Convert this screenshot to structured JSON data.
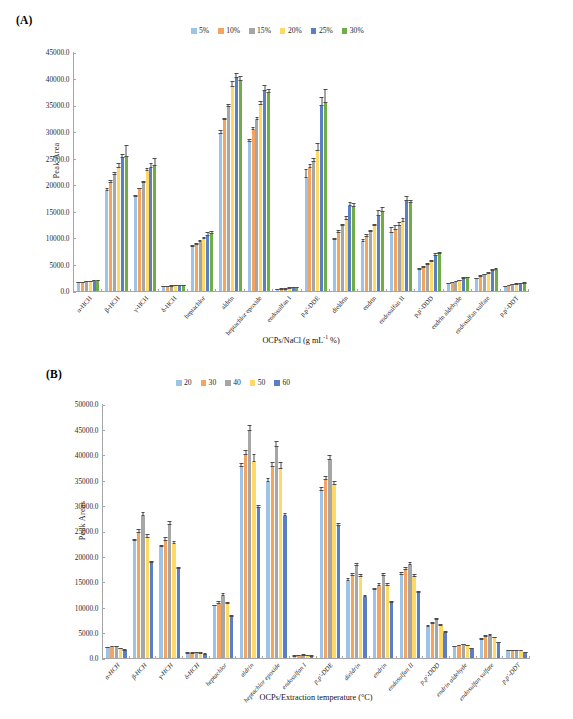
{
  "figure": {
    "panel_a_tag": "(A)",
    "panel_b_tag": "(B)"
  },
  "chart_data": [
    {
      "id": "A",
      "type": "bar",
      "title": "(A)",
      "xlabel": "OCPs/NaCl (g mL-1 %)",
      "xlabel_main": "OCPs/NaCl (g mL",
      "xlabel_sup": "-1",
      "xlabel_tail": " %)",
      "ylabel": "Peak Area",
      "ylim": [
        0,
        45000
      ],
      "ytick_step": 5000,
      "yticks": [
        "0.0",
        "5000.0",
        "10000.0",
        "15000.0",
        "20000.0",
        "25000.0",
        "30000.0",
        "35000.0",
        "40000.0",
        "45000.0"
      ],
      "grid": false,
      "legend_position": "top-center",
      "legend_title": "NaCl concentration",
      "categories": [
        "α-HCH",
        "β-HCH",
        "γ-HCH",
        "δ-HCH",
        "heptachlor",
        "aldrin",
        "heptachlor epoxide",
        "endosulfan I",
        "p,p'-DDE",
        "dieldrin",
        "endrin",
        "endosulfan II",
        "p,p'-DDD",
        "endrin aldehyde",
        "endosulfan sulfate",
        "p,p'-DDT"
      ],
      "colors": [
        "#9DC3E6",
        "#F4A460",
        "#A6A6A6",
        "#FFD966",
        "#5B7FC7",
        "#70AD47"
      ],
      "series": [
        {
          "name": "5%",
          "values": [
            1550,
            18900,
            17700,
            800,
            8400,
            29700,
            28100,
            250,
            21400,
            9600,
            9300,
            10900,
            3900,
            1400,
            2300,
            800
          ],
          "errors": [
            130,
            400,
            350,
            80,
            250,
            600,
            550,
            40,
            1300,
            400,
            450,
            900,
            300,
            120,
            180,
            90
          ]
        },
        {
          "name": "10%",
          "values": [
            1600,
            20400,
            19200,
            850,
            8700,
            32300,
            30400,
            300,
            23200,
            11000,
            10200,
            11600,
            4400,
            1550,
            2700,
            1000
          ],
          "errors": [
            140,
            500,
            250,
            90,
            250,
            350,
            500,
            45,
            600,
            500,
            400,
            700,
            250,
            130,
            200,
            100
          ]
        },
        {
          "name": "15%",
          "values": [
            1650,
            21900,
            20500,
            900,
            9200,
            34800,
            32300,
            350,
            24300,
            12200,
            11100,
            12200,
            4900,
            1700,
            3000,
            1100
          ],
          "errors": [
            180,
            500,
            300,
            100,
            350,
            500,
            450,
            50,
            650,
            450,
            400,
            650,
            300,
            160,
            250,
            110
          ]
        },
        {
          "name": "20%",
          "values": [
            1750,
            23300,
            22600,
            950,
            9800,
            38600,
            35200,
            500,
            26500,
            13500,
            12200,
            13000,
            5500,
            1900,
            3300,
            1250
          ],
          "errors": [
            170,
            700,
            500,
            110,
            400,
            900,
            550,
            60,
            1200,
            500,
            450,
            700,
            350,
            200,
            250,
            120
          ]
        },
        {
          "name": "25%",
          "values": [
            1900,
            25100,
            23300,
            1000,
            10400,
            40200,
            37900,
            600,
            34900,
            16000,
            14200,
            17000,
            6700,
            2300,
            3800,
            1350
          ],
          "errors": [
            180,
            600,
            750,
            120,
            550,
            750,
            900,
            80,
            1500,
            700,
            900,
            800,
            350,
            250,
            350,
            150
          ]
        },
        {
          "name": "30%",
          "values": [
            1900,
            25400,
            23600,
            1000,
            10800,
            39700,
            37400,
            600,
            35500,
            15800,
            15000,
            16600,
            7000,
            2400,
            4000,
            1400
          ],
          "errors": [
            190,
            1800,
            1300,
            120,
            500,
            800,
            600,
            80,
            2200,
            600,
            750,
            550,
            300,
            200,
            300,
            200
          ]
        }
      ]
    },
    {
      "id": "B",
      "type": "bar",
      "title": "(B)",
      "xlabel": "OCPs/Extraction temperature (°C)",
      "ylabel": "Peak  Areas",
      "ylim": [
        0,
        50000
      ],
      "ytick_step": 5000,
      "yticks": [
        "0.0",
        "5000.0",
        "10000.0",
        "15000.0",
        "20000.0",
        "25000.0",
        "30000.0",
        "35000.0",
        "40000.0",
        "45000.0",
        "50000.0"
      ],
      "grid": false,
      "legend_position": "top-center",
      "legend_title": "Extraction temperature",
      "categories": [
        "α-HCH",
        "β-HCH",
        "γ-HCH",
        "δ-HCH",
        "heptachlor",
        "aldrin",
        "heptachlor epoxide",
        "endosulfan I",
        "p,p'-DDE",
        "dieldrin",
        "endrin",
        "endosulfan II",
        "p,p'-DDD",
        "endrin aldehyde",
        "endosulfan sulfate",
        "p,p'-DDT"
      ],
      "colors": [
        "#9DC3E6",
        "#F4A460",
        "#A6A6A6",
        "#FFD966",
        "#5B7FC7"
      ],
      "series": [
        {
          "name": "20",
          "values": [
            1900,
            23100,
            21900,
            900,
            10200,
            37800,
            34800,
            350,
            33000,
            15300,
            13500,
            16500,
            6200,
            2200,
            3600,
            1400
          ],
          "errors": [
            170,
            400,
            300,
            90,
            300,
            550,
            700,
            50,
            600,
            400,
            350,
            450,
            250,
            180,
            250,
            130
          ]
        },
        {
          "name": "30",
          "values": [
            2100,
            24700,
            23200,
            950,
            10700,
            40200,
            37700,
            450,
            35100,
            16200,
            14300,
            17300,
            6700,
            2400,
            4200,
            1450
          ],
          "errors": [
            180,
            600,
            500,
            100,
            400,
            700,
            800,
            60,
            650,
            450,
            400,
            500,
            300,
            200,
            280,
            140
          ]
        },
        {
          "name": "40",
          "values": [
            2100,
            28000,
            26300,
            1000,
            12200,
            44900,
            41800,
            500,
            39200,
            18100,
            16200,
            18300,
            7500,
            2500,
            4300,
            1450
          ],
          "errors": [
            200,
            650,
            550,
            110,
            500,
            850,
            900,
            70,
            700,
            500,
            450,
            550,
            350,
            200,
            300,
            150
          ]
        },
        {
          "name": "50",
          "values": [
            1800,
            23800,
            22600,
            900,
            10600,
            38700,
            37300,
            450,
            34200,
            16100,
            14300,
            16000,
            6300,
            2300,
            3900,
            1350
          ],
          "errors": [
            170,
            500,
            450,
            100,
            400,
            1300,
            1200,
            60,
            600,
            450,
            400,
            500,
            300,
            190,
            250,
            130
          ]
        },
        {
          "name": "60",
          "values": [
            1500,
            18800,
            17600,
            750,
            8100,
            29700,
            28100,
            350,
            26000,
            12100,
            10800,
            12800,
            5000,
            1800,
            2900,
            1000
          ],
          "errors": [
            140,
            350,
            280,
            80,
            280,
            450,
            500,
            50,
            500,
            350,
            300,
            400,
            250,
            150,
            200,
            110
          ]
        }
      ]
    }
  ]
}
